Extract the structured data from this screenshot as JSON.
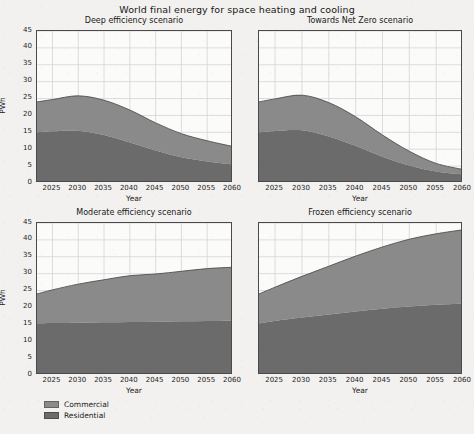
{
  "figure": {
    "title": "World final energy for space heating and cooling",
    "background_color": "#f2f1ef",
    "plot_background_color": "#fbfbfa",
    "grid_color": "#d4d4d4",
    "axis_color": "#4a4a4a"
  },
  "legend": {
    "position": "lower-left",
    "entries": [
      {
        "label": "Commercial",
        "color": "#8a8a8a"
      },
      {
        "label": "Residential",
        "color": "#6b6b6b"
      }
    ]
  },
  "axes": {
    "ylabel": "PWh",
    "xlabel": "Year",
    "yticks": [
      0,
      5,
      10,
      15,
      20,
      25,
      30,
      35,
      40,
      45
    ],
    "ytick_labels": [
      "0",
      "5",
      "10",
      "15",
      "20",
      "25",
      "30",
      "35",
      "40",
      "45"
    ],
    "xticks": [
      2025,
      2030,
      2035,
      2040,
      2045,
      2050,
      2055,
      2060
    ],
    "xtick_labels": [
      "2025",
      "2030",
      "2035",
      "2040",
      "2045",
      "2050",
      "2055",
      "2060"
    ],
    "xlim": [
      2022,
      2060
    ],
    "ylim": [
      0,
      45
    ]
  },
  "chart_data": {
    "type": "area",
    "title": "World final energy for space heating and cooling",
    "xlabel": "Year",
    "ylabel": "PWh",
    "xlim": [
      2022,
      2060
    ],
    "ylim": [
      0,
      45
    ],
    "grid": true,
    "legend_position": "lower-left",
    "stacked": true,
    "x": [
      2022,
      2025,
      2030,
      2035,
      2040,
      2045,
      2050,
      2055,
      2060
    ],
    "panels": [
      {
        "title": "Deep efficiency scenario",
        "position": "top-left",
        "series": [
          {
            "name": "Residential",
            "color": "#6b6b6b",
            "values": [
              15.0,
              15.3,
              15.5,
              14.2,
              12.0,
              9.6,
              7.6,
              6.4,
              5.5
            ]
          },
          {
            "name": "Commercial",
            "color": "#8a8a8a",
            "values": [
              9.0,
              9.4,
              10.3,
              10.3,
              9.6,
              8.2,
              7.0,
              6.1,
              5.3
            ]
          }
        ],
        "totals": [
          24.0,
          24.7,
          25.8,
          24.5,
          21.6,
          17.8,
          14.6,
          12.5,
          10.8
        ]
      },
      {
        "title": "Towards Net Zero scenario",
        "position": "top-right",
        "series": [
          {
            "name": "Residential",
            "color": "#6b6b6b",
            "values": [
              15.0,
              15.4,
              15.6,
              13.8,
              11.0,
              7.8,
              5.2,
              3.4,
              2.5
            ]
          },
          {
            "name": "Commercial",
            "color": "#8a8a8a",
            "values": [
              9.0,
              9.5,
              10.4,
              10.0,
              8.6,
              6.4,
              4.2,
              2.4,
              1.5
            ]
          }
        ],
        "totals": [
          24.0,
          24.9,
          26.0,
          23.8,
          19.6,
          14.2,
          9.4,
          5.8,
          4.0
        ]
      },
      {
        "title": "Moderate efficiency scenario",
        "position": "bottom-left",
        "series": [
          {
            "name": "Residential",
            "color": "#6b6b6b",
            "values": [
              15.3,
              15.4,
              15.5,
              15.6,
              15.7,
              15.8,
              15.9,
              16.0,
              16.1
            ]
          },
          {
            "name": "Commercial",
            "color": "#8a8a8a",
            "values": [
              8.7,
              9.8,
              11.4,
              12.6,
              13.7,
              14.1,
              14.8,
              15.5,
              15.8
            ]
          }
        ],
        "totals": [
          24.0,
          25.2,
          26.9,
          28.2,
          29.4,
          29.9,
          30.7,
          31.5,
          31.9
        ]
      },
      {
        "title": "Frozen efficiency scenario",
        "position": "bottom-right",
        "series": [
          {
            "name": "Residential",
            "color": "#6b6b6b",
            "values": [
              15.3,
              16.0,
              17.0,
              17.9,
              18.8,
              19.6,
              20.3,
              20.8,
              21.1
            ]
          },
          {
            "name": "Commercial",
            "color": "#8a8a8a",
            "values": [
              8.7,
              10.0,
              12.2,
              14.3,
              16.4,
              18.3,
              19.9,
              21.0,
              21.9
            ]
          }
        ],
        "totals": [
          24.0,
          26.0,
          29.2,
          32.2,
          35.2,
          37.9,
          40.2,
          41.8,
          43.0
        ]
      }
    ]
  }
}
